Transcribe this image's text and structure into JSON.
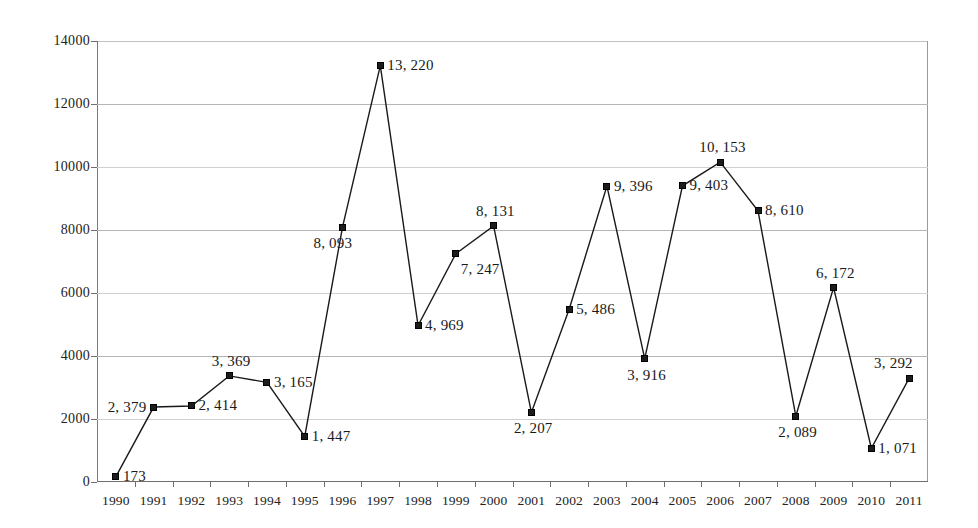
{
  "chart_data": {
    "type": "line",
    "title": "",
    "subtitle": "",
    "xlabel": "",
    "ylabel": "",
    "grid": true,
    "legend": "none",
    "marker": "square",
    "line_color": "#1a1a1a",
    "marker_color": "#1c1c1c",
    "grid_color": "#b5b5b5",
    "ylim": [
      0,
      14000
    ],
    "yticks": [
      0,
      2000,
      4000,
      6000,
      8000,
      10000,
      12000,
      14000
    ],
    "ytick_labels": [
      "0",
      "2000",
      "4000",
      "6000",
      "8000",
      "10000",
      "12000",
      "14000"
    ],
    "categories": [
      "1990",
      "1991",
      "1992",
      "1993",
      "1994",
      "1995",
      "1996",
      "1997",
      "1998",
      "1999",
      "2000",
      "2001",
      "2002",
      "2003",
      "2004",
      "2005",
      "2006",
      "2007",
      "2008",
      "2009",
      "2010",
      "2011"
    ],
    "values": [
      173,
      2379,
      2414,
      3369,
      3165,
      1447,
      8093,
      13220,
      4969,
      7247,
      8131,
      2207,
      5486,
      9396,
      3916,
      9403,
      10153,
      8610,
      2089,
      6172,
      1071,
      3292
    ],
    "value_labels": [
      "173",
      "2, 379",
      "2, 414",
      "3, 369",
      "3, 165",
      "1, 447",
      "8, 093",
      "13, 220",
      "4, 969",
      "7, 247",
      "8, 131",
      "2, 207",
      "5, 486",
      "9, 396",
      "3, 916",
      "9, 403",
      "10, 153",
      "8, 610",
      "2, 089",
      "6, 172",
      "1, 071",
      "3, 292"
    ],
    "label_positions": [
      "right",
      "left",
      "right",
      "above",
      "right",
      "right",
      "below-left",
      "right",
      "right",
      "below-right",
      "above",
      "below",
      "right",
      "right",
      "below",
      "right",
      "above",
      "right",
      "below",
      "above",
      "right",
      "above-left"
    ]
  }
}
